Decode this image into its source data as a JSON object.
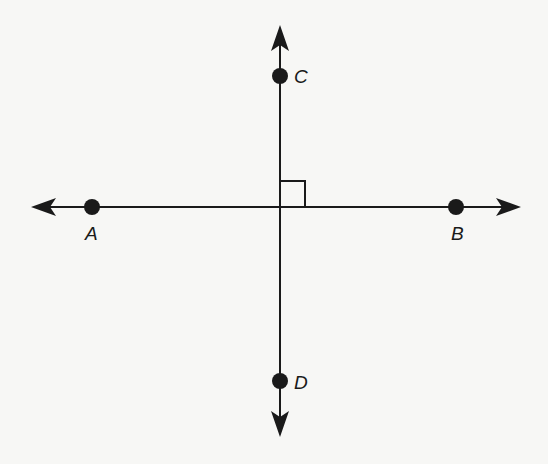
{
  "diagram": {
    "type": "perpendicular-lines",
    "colors": {
      "line": "#1a1a1a",
      "background": "#f7f7f5"
    },
    "lines": [
      {
        "name": "line-AB",
        "orientation": "horizontal",
        "arrows": "both"
      },
      {
        "name": "line-CD",
        "orientation": "vertical",
        "arrows": "both"
      }
    ],
    "points": [
      {
        "label": "A"
      },
      {
        "label": "B"
      },
      {
        "label": "C"
      },
      {
        "label": "D"
      }
    ],
    "right_angle_marker": true
  }
}
